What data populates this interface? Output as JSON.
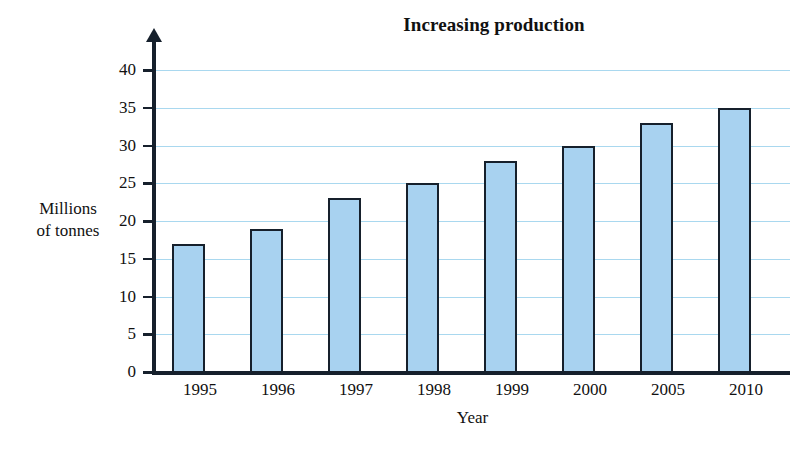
{
  "chart_data": {
    "type": "bar",
    "title": "Increasing production",
    "xlabel": "Year",
    "ylabel": "Millions of tonnes",
    "ylabel_lines": [
      "Millions",
      "of tonnes"
    ],
    "categories": [
      "1995",
      "1996",
      "1997",
      "1998",
      "1999",
      "2000",
      "2005",
      "2010"
    ],
    "values": [
      17,
      19,
      23,
      25,
      28,
      30,
      33,
      35
    ],
    "ylim": [
      0,
      40
    ],
    "ytick_values": [
      0,
      5,
      10,
      15,
      20,
      25,
      30,
      35,
      40
    ],
    "ytick_labels": [
      "0",
      "5",
      "10",
      "15",
      "20",
      "25",
      "30",
      "35",
      "40"
    ],
    "grid": true,
    "grid_axis": "y",
    "legend": false,
    "colors": {
      "bar_fill": "#a8d2f0",
      "bar_edge": "#16202c",
      "gridline": "#a9d8ef",
      "axis": "#16202c",
      "text": "#111111",
      "background": "#ffffff"
    }
  }
}
